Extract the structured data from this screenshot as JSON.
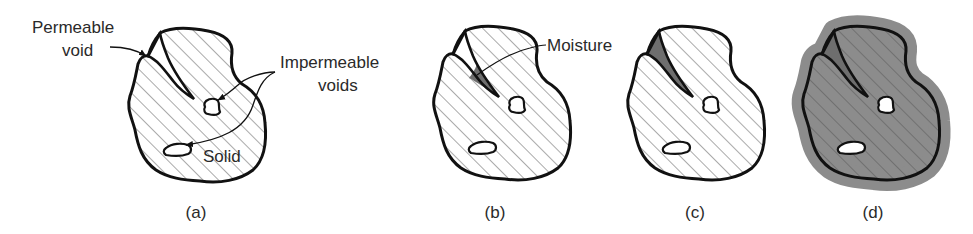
{
  "figure": {
    "panels": [
      {
        "id": "a",
        "caption": "(a)",
        "state": "dry particle"
      },
      {
        "id": "b",
        "caption": "(b)",
        "state": "moisture partially in permeable void"
      },
      {
        "id": "c",
        "caption": "(c)",
        "state": "permeable void filled with moisture"
      },
      {
        "id": "d",
        "caption": "(d)",
        "state": "void filled and surface film of moisture"
      }
    ],
    "labels": {
      "permeable_void_line1": "Permeable",
      "permeable_void_line2": "void",
      "impermeable_line1": "Impermeable",
      "impermeable_line2": "voids",
      "solid": "Solid",
      "moisture": "Moisture"
    },
    "colors": {
      "outline": "#111111",
      "hatch": "#555555",
      "moisture": "#6e6e6e",
      "surface_film": "#8c8c8c",
      "background": "#ffffff"
    }
  }
}
